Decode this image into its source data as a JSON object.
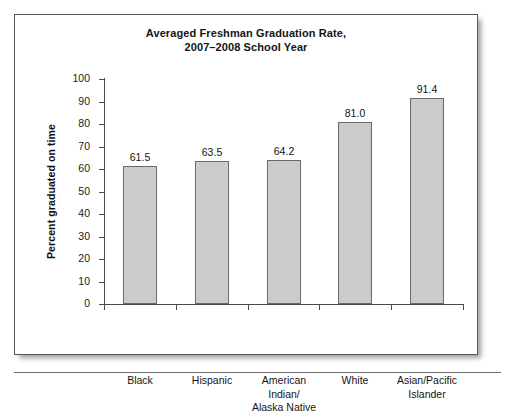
{
  "chart_data": {
    "type": "bar",
    "title": "Averaged Freshman Graduation Rate, 2007–2008 School Year",
    "title_lines": [
      "Averaged Freshman Graduation Rate,",
      "2007–2008 School Year"
    ],
    "xlabel": "",
    "ylabel": "Percent graduated on time",
    "ylim": [
      0,
      100
    ],
    "ytick_labels": [
      "100",
      "90",
      "80",
      "70",
      "60",
      "50",
      "40",
      "30",
      "20",
      "10",
      "0"
    ],
    "ytick_values": [
      100,
      90,
      80,
      70,
      60,
      50,
      40,
      30,
      20,
      10,
      0
    ],
    "grid": false,
    "legend": false,
    "categories": [
      "Black",
      "Hispanic",
      "American Indian/ Alaska Native",
      "White",
      "Asian/Pacific Islander"
    ],
    "category_lines": [
      [
        "Black"
      ],
      [
        "Hispanic"
      ],
      [
        "American",
        "Indian/",
        "Alaska Native"
      ],
      [
        "White"
      ],
      [
        "Asian/Pacific",
        "Islander"
      ]
    ],
    "values": [
      61.5,
      63.5,
      64.2,
      81.0,
      91.4
    ],
    "value_labels": [
      "61.5",
      "63.5",
      "64.2",
      "81.0",
      "91.4"
    ],
    "bar_color": "#cbcbcb",
    "bar_edge_color": "#6a6a6a",
    "axis_color": "#4a4a4a",
    "background_color": "#ffffff"
  }
}
